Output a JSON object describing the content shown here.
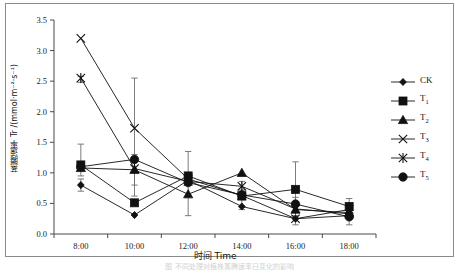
{
  "figure": {
    "caption_strip": "图 不同处理对植株蒸腾速率日变化的影响",
    "ylabel": "蒸腾速率 Tr /(mmol·m⁻²·s⁻¹)",
    "xlabel": "时间 Time"
  },
  "legend": {
    "position": "right",
    "items": [
      {
        "label": "CK",
        "sub": "",
        "marker": "diamond-small"
      },
      {
        "label": "T",
        "sub": "1",
        "marker": "square"
      },
      {
        "label": "T",
        "sub": "2",
        "marker": "triangle"
      },
      {
        "label": "T",
        "sub": "3",
        "marker": "cross-x"
      },
      {
        "label": "T",
        "sub": "4",
        "marker": "asterisk"
      },
      {
        "label": "T",
        "sub": "5",
        "marker": "circle"
      }
    ]
  },
  "chart_data": {
    "type": "line",
    "title": "",
    "xlabel": "时间 Time",
    "ylabel": "蒸腾速率 Tr /(mmol·m⁻²·s⁻¹)",
    "categories": [
      "8:00",
      "10:00",
      "12:00",
      "14:00",
      "16:00",
      "18:00"
    ],
    "ylim": [
      0.0,
      3.5
    ],
    "yticks": [
      "0.0",
      "0.5",
      "1.0",
      "1.5",
      "2.0",
      "2.5",
      "3.0",
      "3.5"
    ],
    "ytick_values": [
      0.0,
      0.5,
      1.0,
      1.5,
      2.0,
      2.5,
      3.0,
      3.5
    ],
    "grid": false,
    "legend_position": "right",
    "series": [
      {
        "name": "CK",
        "marker": "diamond-small",
        "values": [
          0.8,
          0.31,
          0.88,
          0.45,
          0.25,
          0.3
        ]
      },
      {
        "name": "T1",
        "marker": "square",
        "values": [
          1.13,
          0.51,
          0.95,
          0.62,
          0.73,
          0.45
        ]
      },
      {
        "name": "T2",
        "marker": "triangle",
        "values": [
          1.08,
          1.05,
          0.65,
          1.0,
          0.4,
          0.35
        ]
      },
      {
        "name": "T3",
        "marker": "cross-x",
        "values": [
          3.2,
          1.73,
          0.9,
          0.63,
          0.25,
          0.4
        ]
      },
      {
        "name": "T4",
        "marker": "asterisk",
        "values": [
          2.55,
          1.07,
          0.86,
          0.78,
          0.41,
          0.33
        ]
      },
      {
        "name": "T5",
        "marker": "circle",
        "values": [
          1.1,
          1.22,
          0.84,
          0.64,
          0.49,
          0.28
        ]
      }
    ],
    "error_bars": [
      {
        "at": "8:00",
        "series": "T1",
        "value": 1.13,
        "low": 0.95,
        "high": 1.47
      },
      {
        "at": "8:00",
        "series": "T4",
        "value": 2.55,
        "low": 2.48,
        "high": 2.58
      },
      {
        "at": "8:00",
        "series": "CK",
        "value": 0.8,
        "low": 0.7,
        "high": 0.9
      },
      {
        "at": "10:00",
        "series": "T5",
        "value": 1.22,
        "low": 0.62,
        "high": 2.55
      },
      {
        "at": "10:00",
        "series": "T2",
        "value": 1.05,
        "low": 0.8,
        "high": 1.3
      },
      {
        "at": "12:00",
        "series": "T1",
        "value": 0.95,
        "low": 0.3,
        "high": 1.35
      },
      {
        "at": "14:00",
        "series": "T4",
        "value": 0.78,
        "low": 0.7,
        "high": 0.86
      },
      {
        "at": "14:00",
        "series": "T1",
        "value": 0.62,
        "low": 0.4,
        "high": 0.72
      },
      {
        "at": "16:00",
        "series": "T1",
        "value": 0.73,
        "low": 0.48,
        "high": 1.18
      },
      {
        "at": "16:00",
        "series": "T5",
        "value": 0.49,
        "low": 0.3,
        "high": 0.6
      },
      {
        "at": "16:00",
        "series": "CK",
        "value": 0.25,
        "low": 0.15,
        "high": 0.35
      },
      {
        "at": "18:00",
        "series": "T1",
        "value": 0.45,
        "low": 0.15,
        "high": 0.58
      }
    ]
  }
}
